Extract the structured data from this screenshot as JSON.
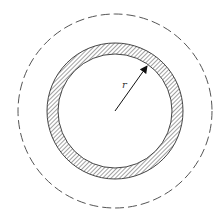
{
  "diagram": {
    "type": "concentric-circles",
    "center": {
      "x": 115,
      "y": 111
    },
    "outer_dashed_circle": {
      "radius": 97,
      "style": "dashed",
      "color": "#555555"
    },
    "hatched_ring": {
      "outer_radius": 68,
      "inner_radius": 57,
      "hatch": "diagonal",
      "color": "#444444"
    },
    "radius_arrow": {
      "from": {
        "x": 115,
        "y": 111
      },
      "to": {
        "x": 147,
        "y": 65
      },
      "color": "#111111"
    },
    "labels": {
      "radius_label": "r"
    }
  }
}
